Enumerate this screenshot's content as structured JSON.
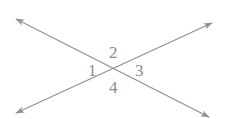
{
  "diagram": {
    "type": "intersecting-lines",
    "line_color": "#929292",
    "label_color": "#8c8c8c",
    "intersection": {
      "x": 115,
      "y": 68
    },
    "lines": [
      {
        "name": "line-a",
        "from": {
          "x": 16,
          "y": 19
        },
        "to": {
          "x": 209,
          "y": 117
        }
      },
      {
        "name": "line-b",
        "from": {
          "x": 16,
          "y": 113
        },
        "to": {
          "x": 212,
          "y": 23
        }
      }
    ],
    "angle_labels": [
      {
        "text": "1",
        "x": 88,
        "y": 76
      },
      {
        "text": "2",
        "x": 109,
        "y": 58
      },
      {
        "text": "3",
        "x": 135,
        "y": 76
      },
      {
        "text": "4",
        "x": 109,
        "y": 93
      }
    ]
  }
}
